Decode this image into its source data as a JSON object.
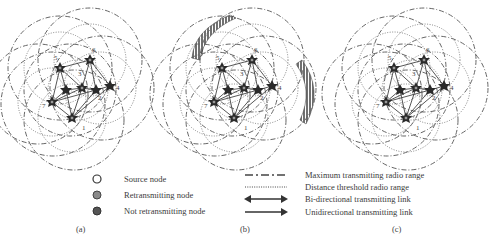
{
  "figure": {
    "panels": [
      {
        "id": "a",
        "label": "(a)",
        "shaded_regions": false
      },
      {
        "id": "b",
        "label": "(b)",
        "shaded_regions": true
      },
      {
        "id": "c",
        "label": "(c)",
        "shaded_regions": false
      }
    ],
    "node_labels": [
      "1",
      "2",
      "3",
      "4",
      "5",
      "6",
      "7"
    ],
    "legend_nodes": [
      {
        "icon": "source-node-icon",
        "label": "Source node",
        "fill": "#ffffff"
      },
      {
        "icon": "retransmitting-node-icon",
        "label": "Retransmitting node",
        "fill": "#8a8a8a"
      },
      {
        "icon": "not-retransmitting-node-icon",
        "label": "Not retransmitting node",
        "fill": "#555555"
      }
    ],
    "legend_lines": [
      {
        "icon": "dash-dot-line-icon",
        "label": "Maximum transmitting radio range"
      },
      {
        "icon": "dotted-line-icon",
        "label": "Distance threshold radio range"
      },
      {
        "icon": "double-arrow-icon",
        "label": "Bi-directional transmitting link"
      },
      {
        "icon": "single-arrow-icon",
        "label": "Unidirectional transmitting link"
      }
    ],
    "colors": {
      "line": "#555555",
      "node_dark": "#2a2a2a",
      "hatch": "#444444"
    }
  }
}
